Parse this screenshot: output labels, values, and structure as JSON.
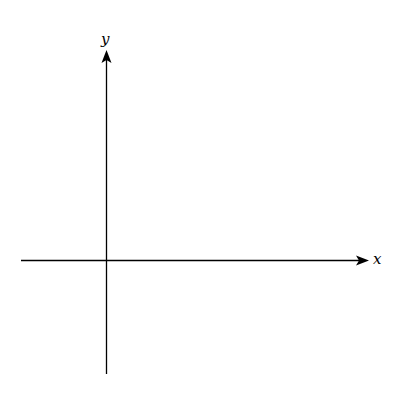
{
  "diagram": {
    "type": "coordinate-axes",
    "x_axis": {
      "label": "x"
    },
    "y_axis": {
      "label": "y"
    },
    "color": "#000000"
  }
}
